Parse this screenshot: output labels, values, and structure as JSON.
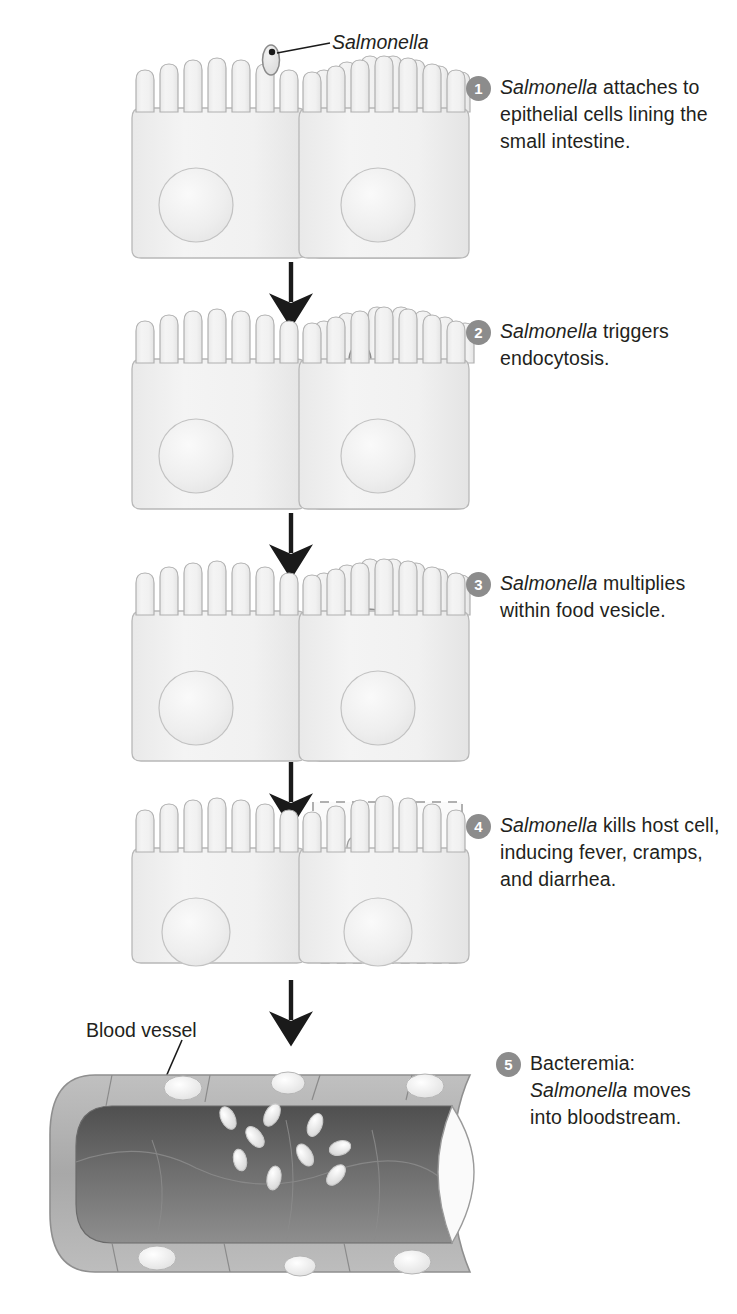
{
  "figure": {
    "organism": "Salmonella",
    "colors": {
      "badge": "#8c8c8c",
      "badge_text": "#ffffff",
      "text": "#231f20",
      "cell_fill": "#f1f1f1",
      "cell_stroke": "#b8b8b8",
      "nucleus_fill": "#ededed",
      "nucleus_stroke": "#c2c2c2",
      "bacterium_fill": "#e4e4e4",
      "bacterium_stroke": "#9a9a9a",
      "vessel_wall": "#b0b0b0",
      "vessel_lumen": "#6f6f6f",
      "vessel_lumen_dark": "#555555",
      "arrow": "#1a1a1a",
      "background": "#ffffff"
    }
  },
  "annotations": {
    "salmonella_label": "Salmonella",
    "blood_vessel_label": "Blood vessel"
  },
  "steps": [
    {
      "number": "1",
      "caption_italic": "Salmonella",
      "caption_rest": " attaches to epithelial cells lining the small intestine.",
      "full_text": "Salmonella attaches to epithelial cells lining the small intestine."
    },
    {
      "number": "2",
      "caption_italic": "Salmonella",
      "caption_rest": " triggers endocytosis.",
      "full_text": "Salmonella triggers endocytosis."
    },
    {
      "number": "3",
      "caption_italic": "Salmonella",
      "caption_rest": " multiplies within food vesicle.",
      "full_text": "Salmonella multiplies within food vesicle."
    },
    {
      "number": "4",
      "caption_italic": "Salmonella",
      "caption_rest": " kills host cell, inducing fever, cramps, and diarrhea.",
      "full_text": "Salmonella kills host cell, inducing fever, cramps, and diarrhea."
    },
    {
      "number": "5",
      "caption_prefix": "Bacteremia: ",
      "caption_italic": "Salmonella",
      "caption_rest": " moves into bloodstream.",
      "full_text": "Bacteremia: Salmonella moves into bloodstream."
    }
  ],
  "diagram": {
    "stage_count": 5,
    "arrow_count": 4,
    "epithelial_cells_per_stage": 3,
    "microvilli_per_cell": 7,
    "stage1_bacteria_count": 1,
    "stage2_bacteria_count": 1,
    "stage3_bacteria_count": 5,
    "stage4_bacteria_count": 4,
    "stage5_bacteria_count": 9,
    "stage4_dead_cell_outline": "dashed",
    "vessel_nuclei_count": 6
  }
}
